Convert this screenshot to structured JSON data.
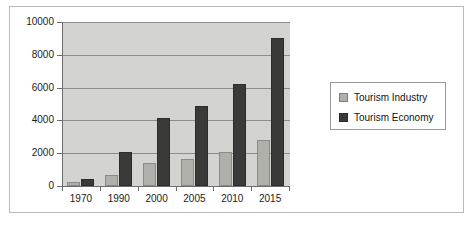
{
  "chart_data": {
    "type": "bar",
    "title": "",
    "xlabel": "",
    "ylabel": "",
    "categories": [
      "1970",
      "1990",
      "2000",
      "2005",
      "2010",
      "2015"
    ],
    "series": [
      {
        "name": "Tourism Industry",
        "color": "#b0b0ab",
        "values": [
          250,
          700,
          1400,
          1650,
          2100,
          2800
        ]
      },
      {
        "name": "Tourism Economy",
        "color": "#3a3a38",
        "values": [
          450,
          2100,
          4150,
          4850,
          6200,
          9000
        ]
      }
    ],
    "ylim": [
      0,
      10000
    ],
    "yticks": [
      "0",
      "2000",
      "4000",
      "6000",
      "8000",
      "10000"
    ],
    "ytick_values": [
      0,
      2000,
      4000,
      6000,
      8000,
      10000
    ],
    "grid": true,
    "legend_position": "right",
    "plot_background": "#d3d3cf",
    "axis_color": "#6d6d6d",
    "gridline_color": "#8d8d88"
  },
  "legend": {
    "items": [
      {
        "label": "Tourism Industry",
        "swatch": "industry"
      },
      {
        "label": "Tourism Economy",
        "swatch": "economy"
      }
    ]
  }
}
